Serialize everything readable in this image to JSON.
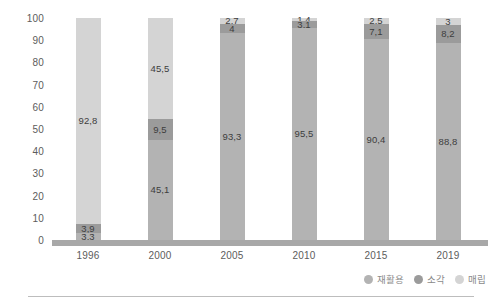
{
  "chart_data": {
    "type": "bar",
    "subtype": "stacked-column-100",
    "title": "",
    "subtitle": "",
    "xlabel": "",
    "ylabel": "",
    "ylim": [
      0,
      100
    ],
    "y_ticks": [
      "0",
      "10",
      "20",
      "30",
      "40",
      "50",
      "60",
      "70",
      "80",
      "90",
      "100"
    ],
    "grid": false,
    "legend_position": "bottom-right",
    "categories": [
      "1996",
      "2000",
      "2005",
      "2010",
      "2015",
      "2019"
    ],
    "series": [
      {
        "name": "재활용",
        "color": "#b3b3b3",
        "values": [
          3.3,
          45.1,
          93.3,
          95.5,
          90.4,
          88.8
        ],
        "labels": [
          "3,3",
          "45,1",
          "93,3",
          "95,5",
          "90,4",
          "88,8"
        ]
      },
      {
        "name": "소각",
        "color": "#9b9b9b",
        "values": [
          3.9,
          9.5,
          4,
          3.1,
          7.1,
          8.2
        ],
        "labels": [
          "3,9",
          "9,5",
          "4",
          "3,1",
          "7,1",
          "8,2"
        ]
      },
      {
        "name": "매립",
        "color": "#d4d4d4",
        "values": [
          92.8,
          45.5,
          2.7,
          1.4,
          2.5,
          3
        ],
        "labels": [
          "92,8",
          "45,5",
          "2,7",
          "1,4",
          "2,5",
          "3"
        ]
      }
    ],
    "colors": {
      "recycling": "#b3b3b3",
      "incineration": "#9b9b9b",
      "landfill": "#d4d4d4",
      "baseline": "#a8a8a8",
      "tick_text": "#5c5c5c",
      "label_text": "#3d3d3d",
      "legend_text": "#8a8a8a"
    }
  }
}
